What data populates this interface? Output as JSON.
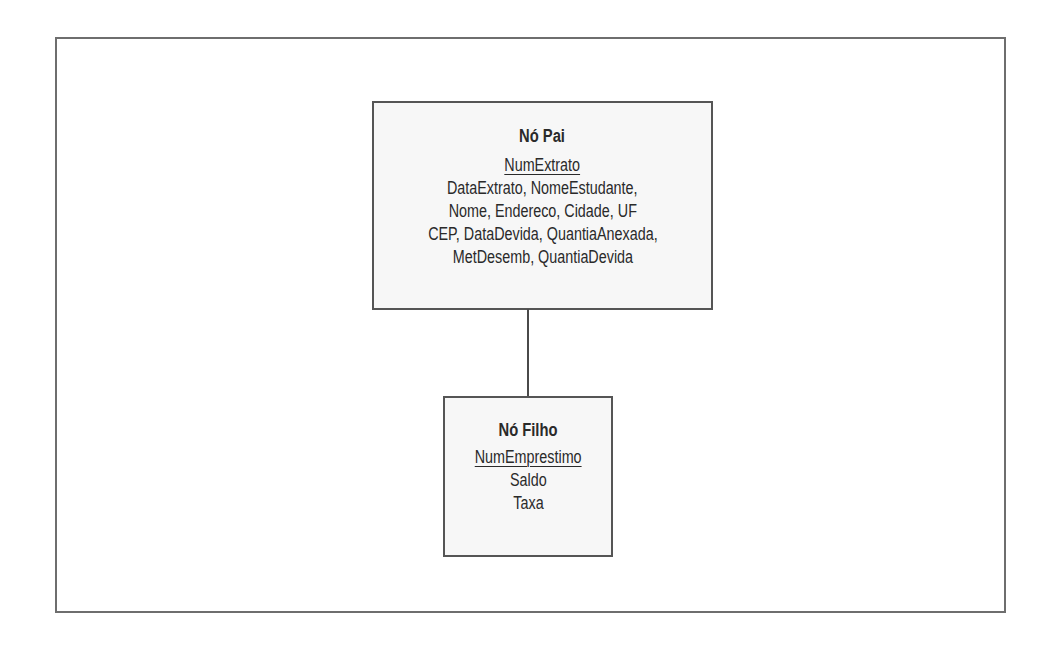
{
  "diagram": {
    "type": "hierarchical-model",
    "parent_node": {
      "title": "Nó Pai",
      "key": "NumExtrato",
      "attribute_lines": [
        "DataExtrato, NomeEstudante,",
        "Nome, Endereco, Cidade, UF",
        "CEP, DataDevida, QuantiaAnexada,",
        "MetDesemb, QuantiaDevida"
      ]
    },
    "child_node": {
      "title": "Nó Filho",
      "key": "NumEmprestimo",
      "attribute_lines": [
        "Saldo",
        "Taxa"
      ]
    },
    "relationship": {
      "from": "Nó Pai",
      "to": "Nó Filho"
    }
  }
}
